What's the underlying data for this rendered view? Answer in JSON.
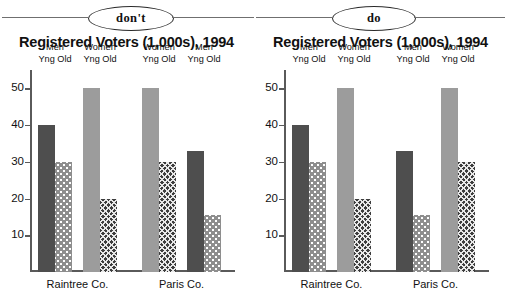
{
  "badges": {
    "dont_label": "don't",
    "do_label": "do"
  },
  "colors": {
    "bar_dark": "#4e4e4e",
    "bar_light": "#9c9c9c",
    "bar_dots": "#8e8e8e",
    "bar_cross": "#3d3d3d",
    "axis": "#5a5a5a",
    "text": "#111111",
    "background": "#ffffff"
  },
  "chart_data": [
    {
      "panel": "dont",
      "type": "bar",
      "title": "Registered Voters (1,000s), 1994",
      "xlabel": "",
      "ylabel": "",
      "ylim": [
        0,
        55
      ],
      "yticks": [
        10,
        20,
        30,
        40,
        50
      ],
      "ytick_labels": [
        "10",
        "20",
        "30",
        "40",
        "50"
      ],
      "grid": false,
      "legend": "column-headers",
      "categories": [
        "Raintree Co.",
        "Paris Co."
      ],
      "column_headers": [
        {
          "group": "Men",
          "sub": "Yng Old"
        },
        {
          "group": "Women",
          "sub": "Yng Old"
        },
        {
          "group": "Women",
          "sub": "Yng Old"
        },
        {
          "group": "Men",
          "sub": "Yng Old"
        }
      ],
      "bars": [
        {
          "category": "Raintree Co.",
          "group": "Men",
          "age": "Yng",
          "value": 40,
          "fill": "dark"
        },
        {
          "category": "Raintree Co.",
          "group": "Men",
          "age": "Old",
          "value": 30,
          "fill": "dots"
        },
        {
          "category": "Raintree Co.",
          "group": "Women",
          "age": "Yng",
          "value": 50,
          "fill": "light"
        },
        {
          "category": "Raintree Co.",
          "group": "Women",
          "age": "Old",
          "value": 20,
          "fill": "cross"
        },
        {
          "category": "Paris Co.",
          "group": "Women",
          "age": "Yng",
          "value": 50,
          "fill": "light"
        },
        {
          "category": "Paris Co.",
          "group": "Women",
          "age": "Old",
          "value": 30,
          "fill": "cross"
        },
        {
          "category": "Paris Co.",
          "group": "Men",
          "age": "Yng",
          "value": 33,
          "fill": "dark"
        },
        {
          "category": "Paris Co.",
          "group": "Men",
          "age": "Old",
          "value": 15.5,
          "fill": "dots"
        }
      ],
      "series": [
        {
          "name": "Men Yng",
          "values": [
            40,
            33
          ]
        },
        {
          "name": "Men Old",
          "values": [
            30,
            15.5
          ]
        },
        {
          "name": "Women Yng",
          "values": [
            50,
            50
          ]
        },
        {
          "name": "Women Old",
          "values": [
            20,
            30
          ]
        }
      ],
      "annotation": "Series order is inconsistent between the two categories."
    },
    {
      "panel": "do",
      "type": "bar",
      "title": "Registered Voters (1,000s), 1994",
      "xlabel": "",
      "ylabel": "",
      "ylim": [
        0,
        55
      ],
      "yticks": [
        10,
        20,
        30,
        40,
        50
      ],
      "ytick_labels": [
        "10",
        "20",
        "30",
        "40",
        "50"
      ],
      "grid": false,
      "legend": "column-headers",
      "categories": [
        "Raintree Co.",
        "Paris Co."
      ],
      "column_headers": [
        {
          "group": "Men",
          "sub": "Yng Old"
        },
        {
          "group": "Women",
          "sub": "Yng Old"
        },
        {
          "group": "Men",
          "sub": "Yng Old"
        },
        {
          "group": "Women",
          "sub": "Yng Old"
        }
      ],
      "bars": [
        {
          "category": "Raintree Co.",
          "group": "Men",
          "age": "Yng",
          "value": 40,
          "fill": "dark"
        },
        {
          "category": "Raintree Co.",
          "group": "Men",
          "age": "Old",
          "value": 30,
          "fill": "dots"
        },
        {
          "category": "Raintree Co.",
          "group": "Women",
          "age": "Yng",
          "value": 50,
          "fill": "light"
        },
        {
          "category": "Raintree Co.",
          "group": "Women",
          "age": "Old",
          "value": 20,
          "fill": "cross"
        },
        {
          "category": "Paris Co.",
          "group": "Men",
          "age": "Yng",
          "value": 33,
          "fill": "dark"
        },
        {
          "category": "Paris Co.",
          "group": "Men",
          "age": "Old",
          "value": 15.5,
          "fill": "dots"
        },
        {
          "category": "Paris Co.",
          "group": "Women",
          "age": "Yng",
          "value": 50,
          "fill": "light"
        },
        {
          "category": "Paris Co.",
          "group": "Women",
          "age": "Old",
          "value": 30,
          "fill": "cross"
        }
      ],
      "series": [
        {
          "name": "Men Yng",
          "values": [
            40,
            33
          ]
        },
        {
          "name": "Men Old",
          "values": [
            30,
            15.5
          ]
        },
        {
          "name": "Women Yng",
          "values": [
            50,
            50
          ]
        },
        {
          "name": "Women Old",
          "values": [
            20,
            30
          ]
        }
      ],
      "annotation": "Series order is consistent across both categories."
    }
  ]
}
